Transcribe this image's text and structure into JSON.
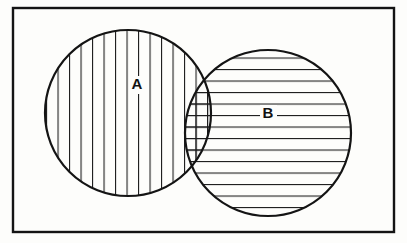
{
  "figure": {
    "type": "venn-diagram",
    "canvas": {
      "width": 407,
      "height": 243,
      "background": "#fdfdfb"
    },
    "universe": {
      "label": "",
      "shape": "rectangle",
      "x": 13,
      "y": 8,
      "width": 381,
      "height": 224,
      "stroke": "#141414",
      "stroke_width": 2.4,
      "fill": "#fdfdfb"
    },
    "sets": [
      {
        "id": "A",
        "label": "A",
        "shape": "circle",
        "cx": 128,
        "cy": 113,
        "r": 83,
        "stroke": "#141414",
        "stroke_width": 2.2,
        "fill": "none",
        "hatch": "vertical",
        "hatch_spacing": 11.5,
        "hatch_stroke": "#1c1c1c",
        "hatch_width": 1.1,
        "label_x": 137,
        "label_y": 85
      },
      {
        "id": "B",
        "label": "B",
        "shape": "circle",
        "cx": 268,
        "cy": 133,
        "r": 83,
        "stroke": "#141414",
        "stroke_width": 2.2,
        "fill": "none",
        "hatch": "horizontal",
        "hatch_spacing": 11.5,
        "hatch_stroke": "#1c1c1c",
        "hatch_width": 1.1,
        "label_x": 268,
        "label_y": 114
      }
    ],
    "intersection": {
      "id": "A-and-B",
      "label": "",
      "hatch": "cross",
      "description": "overlap of circle A and circle B shown with both vertical and horizontal hatching"
    },
    "colors": {
      "ink": "#141414",
      "hatch": "#1c1c1c",
      "paper": "#fdfdfb"
    }
  }
}
